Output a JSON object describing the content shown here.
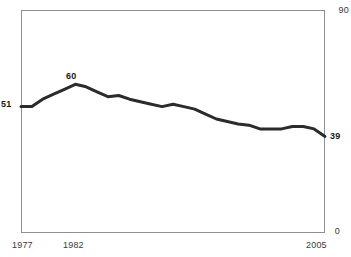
{
  "figure": {
    "title": "",
    "background_color": "#ffffff",
    "frame_color": "#8d8f93",
    "line_color": "#2b2b2b"
  },
  "axis": {
    "y_max_label": "90",
    "y_min_label": "0",
    "x_start_label": "1977",
    "x_mid_label": "1982",
    "x_end_label": "2005"
  },
  "annotations": {
    "start_value": "51",
    "peak_value": "60",
    "end_value": "39"
  },
  "chart_data": {
    "type": "line",
    "title": "",
    "xlabel": "",
    "ylabel": "",
    "xlim": [
      1977,
      2005
    ],
    "ylim": [
      0,
      90
    ],
    "grid": false,
    "legend": null,
    "line_color": "#2b2b2b",
    "line_width": 3,
    "x": [
      1977,
      1978,
      1979,
      1980,
      1981,
      1982,
      1983,
      1984,
      1985,
      1986,
      1987,
      1988,
      1989,
      1990,
      1991,
      1992,
      1993,
      1994,
      1995,
      1996,
      1997,
      1998,
      1999,
      2000,
      2001,
      2002,
      2003,
      2004,
      2005
    ],
    "values": [
      51,
      51,
      54,
      56,
      58,
      60,
      59,
      57,
      55,
      55.5,
      54,
      53,
      52,
      51,
      52,
      51,
      50,
      48,
      46,
      45,
      44,
      43.5,
      42,
      42,
      42,
      43,
      43,
      42,
      39
    ],
    "annotated_points": [
      {
        "x": 1977,
        "y": 51,
        "label": "51"
      },
      {
        "x": 1982,
        "y": 60,
        "label": "60"
      },
      {
        "x": 2005,
        "y": 39,
        "label": "39"
      }
    ]
  }
}
